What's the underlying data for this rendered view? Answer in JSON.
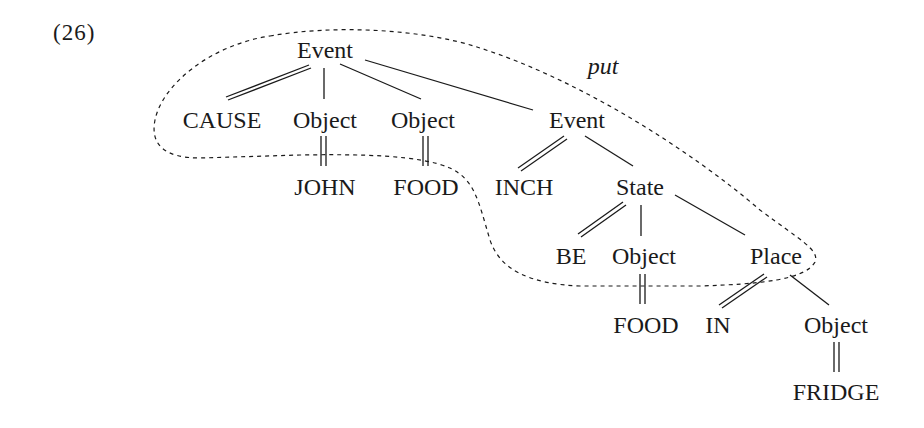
{
  "example_number": "(26)",
  "bracket_label": "put",
  "nodes": {
    "root_event": "Event",
    "cause": "CAUSE",
    "object1": "Object",
    "object2": "Object",
    "event2": "Event",
    "john": "JOHN",
    "food1": "FOOD",
    "inch": "INCH",
    "state": "State",
    "be": "BE",
    "object3": "Object",
    "place": "Place",
    "food2": "FOOD",
    "in": "IN",
    "object4": "Object",
    "fridge": "FRIDGE"
  },
  "edges": [
    {
      "from": "root_event",
      "to": "cause",
      "type": "double"
    },
    {
      "from": "root_event",
      "to": "object1",
      "type": "single"
    },
    {
      "from": "root_event",
      "to": "object2",
      "type": "single"
    },
    {
      "from": "root_event",
      "to": "event2",
      "type": "single"
    },
    {
      "from": "object1",
      "to": "john",
      "type": "double"
    },
    {
      "from": "object2",
      "to": "food1",
      "type": "double"
    },
    {
      "from": "event2",
      "to": "inch",
      "type": "double"
    },
    {
      "from": "event2",
      "to": "state",
      "type": "single"
    },
    {
      "from": "state",
      "to": "be",
      "type": "double"
    },
    {
      "from": "state",
      "to": "object3",
      "type": "single"
    },
    {
      "from": "state",
      "to": "place",
      "type": "single"
    },
    {
      "from": "object3",
      "to": "food2",
      "type": "double"
    },
    {
      "from": "place",
      "to": "in",
      "type": "double"
    },
    {
      "from": "place",
      "to": "object4",
      "type": "single"
    },
    {
      "from": "object4",
      "to": "fridge",
      "type": "double"
    }
  ]
}
